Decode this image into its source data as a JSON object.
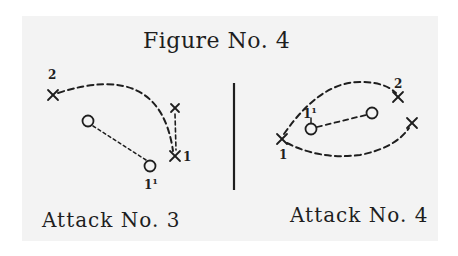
{
  "figure": {
    "title": "Figure No. 4",
    "colors": {
      "ink": "#1e1e1e",
      "paper": "#f3f3f3",
      "background": "#ffffff"
    }
  },
  "attack3": {
    "caption": "Attack No. 3",
    "players": [
      {
        "type": "X",
        "label": "2",
        "x": 53,
        "y": 95
      },
      {
        "type": "X",
        "label": "",
        "x": 175,
        "y": 108
      },
      {
        "type": "X",
        "label": "1",
        "x": 175,
        "y": 156
      },
      {
        "type": "O",
        "label": "",
        "x": 88,
        "y": 121
      },
      {
        "type": "O",
        "label": "1¹",
        "x": 150,
        "y": 166
      }
    ],
    "label_2": "2",
    "label_1": "1",
    "label_1p": "1",
    "label_1p_sup": "1"
  },
  "attack4": {
    "caption": "Attack No. 4",
    "players": [
      {
        "type": "X",
        "label": "1",
        "x": 282,
        "y": 139
      },
      {
        "type": "X",
        "label": "2",
        "x": 398,
        "y": 97
      },
      {
        "type": "X",
        "label": "",
        "x": 412,
        "y": 123
      },
      {
        "type": "O",
        "label": "1¹",
        "x": 311,
        "y": 129
      },
      {
        "type": "O",
        "label": "",
        "x": 372,
        "y": 113
      }
    ],
    "label_2": "2",
    "label_1": "1",
    "label_1p": "1",
    "label_1p_sup": "1"
  }
}
